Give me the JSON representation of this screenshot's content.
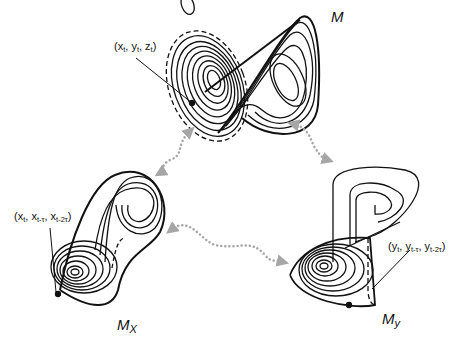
{
  "diagram": {
    "manifolds": [
      {
        "id": "M",
        "name": "M",
        "subscript": "",
        "point_label": {
          "v1": "x",
          "s1": "t",
          "v2": "y",
          "s2": "t",
          "v3": "z",
          "s3": "t"
        }
      },
      {
        "id": "Mx",
        "name": "M",
        "subscript": "X",
        "point_label": {
          "v1": "x",
          "s1": "t",
          "v2": "x",
          "s2": "t-τ",
          "v3": "x",
          "s3": "t-2τ"
        }
      },
      {
        "id": "My",
        "name": "M",
        "subscript": "y",
        "point_label": {
          "v1": "y",
          "s1": "t",
          "v2": "y",
          "s2": "t-τ",
          "v3": "y",
          "s3": "t-2τ"
        }
      }
    ],
    "connections": [
      {
        "from": "M",
        "to": "Mx",
        "style": "dotted double arrow"
      },
      {
        "from": "M",
        "to": "My",
        "style": "dotted double arrow"
      },
      {
        "from": "Mx",
        "to": "My",
        "style": "dotted double arrow"
      }
    ],
    "colors": {
      "curve": "#111111",
      "arrow": "#a6a6a6",
      "background": "#ffffff"
    }
  }
}
